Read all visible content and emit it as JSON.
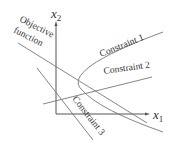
{
  "diagram": {
    "axes": {
      "x_label_main": "x",
      "x_label_sub": "1",
      "y_label_main": "x",
      "y_label_sub": "2"
    },
    "labels": {
      "objective_line1": "Objective",
      "objective_line2": "function",
      "constraint1": "Constraint 1",
      "constraint2": "Constraint 2",
      "constraint3": "Constraint 3"
    },
    "colors": {
      "axis": "#555555",
      "line": "#777777",
      "text": "#333333"
    }
  }
}
